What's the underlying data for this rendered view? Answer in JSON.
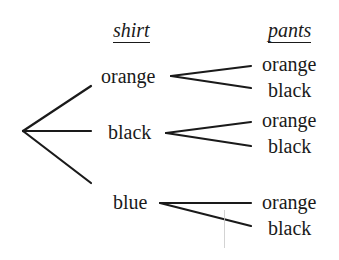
{
  "headers": {
    "shirt": "shirt",
    "pants": "pants"
  },
  "tree": {
    "root": "",
    "shirts": [
      {
        "label": "orange",
        "pants": [
          "orange",
          "black"
        ]
      },
      {
        "label": "black",
        "pants": [
          "orange",
          "black"
        ]
      },
      {
        "label": "blue",
        "pants": [
          "orange",
          "black"
        ]
      }
    ]
  },
  "colors": {
    "ink": "#1a1a1a",
    "background": "#ffffff",
    "artifact": "#c8c8c8"
  }
}
